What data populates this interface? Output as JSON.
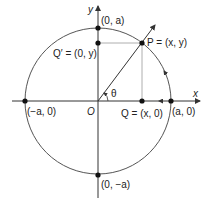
{
  "diagram": {
    "type": "unit-circle-parametrization",
    "axes": {
      "x_label": "x",
      "y_label": "y",
      "origin_label": "O"
    },
    "angle_label": "θ",
    "points": {
      "top": "(0, a)",
      "bottom": "(0, −a)",
      "left": "(−a, 0)",
      "right": "(a, 0)",
      "P": "P = (x, y)",
      "Q": "Q = (x, 0)",
      "Q_prime": "Q′ = (0, y)"
    },
    "colors": {
      "lines": "#333333",
      "guide": "#999999",
      "points": "#111111"
    }
  }
}
